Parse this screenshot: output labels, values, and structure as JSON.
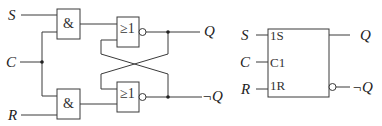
{
  "left_circuit": {
    "inputs": {
      "s": "S",
      "c": "C",
      "r": "R"
    },
    "and_gate_symbol": "&",
    "nor_gate_symbol": "≥1",
    "outputs": {
      "q": "Q",
      "not_q": "¬Q"
    }
  },
  "right_symbol": {
    "inputs": {
      "s": "S",
      "c": "C",
      "r": "R"
    },
    "pins": {
      "set": "1S",
      "clock": "C1",
      "reset": "1R"
    },
    "outputs": {
      "q": "Q",
      "not_q": "¬Q"
    }
  },
  "colors": {
    "line": "#3a3a3a",
    "text": "#222222",
    "background": "#ffffff"
  }
}
